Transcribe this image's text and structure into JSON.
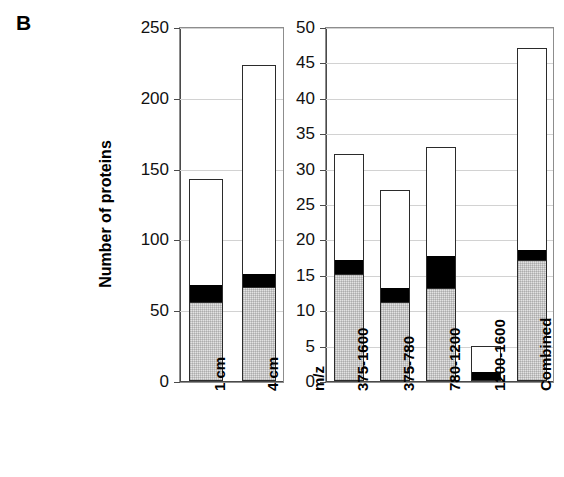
{
  "figure": {
    "panel_letter": "B",
    "y_axis_title": "Number of proteins"
  },
  "chart_data": [
    {
      "id": "left",
      "type": "bar",
      "stacked": true,
      "title": "",
      "xlabel": "",
      "ylabel": "Number of proteins",
      "ylim": [
        0,
        250
      ],
      "yticks": [
        0,
        50,
        100,
        150,
        200,
        250
      ],
      "ytick_labels": [
        "0",
        "50",
        "100",
        "150",
        "200",
        "250"
      ],
      "grid": true,
      "legend": "none",
      "categories": [
        "1 cm",
        "4 cm"
      ],
      "series": [
        {
          "name": "gray-segment",
          "color": "#e2e2e2",
          "values": [
            55,
            66
          ]
        },
        {
          "name": "black-segment",
          "color": "#000000",
          "values": [
            12,
            9
          ]
        },
        {
          "name": "white-segment",
          "color": "#ffffff",
          "values": [
            76,
            148
          ]
        }
      ],
      "totals": [
        143,
        223
      ]
    },
    {
      "id": "right",
      "type": "bar",
      "stacked": true,
      "title": "",
      "xlabel": "m/z",
      "ylabel": "",
      "ylim": [
        0,
        50
      ],
      "yticks": [
        0,
        5,
        10,
        15,
        20,
        25,
        30,
        35,
        40,
        45,
        50
      ],
      "ytick_labels": [
        "0",
        "5",
        "10",
        "15",
        "20",
        "25",
        "30",
        "35",
        "40",
        "45",
        "50"
      ],
      "grid": true,
      "legend": "none",
      "categories": [
        "375-1600",
        "375-780",
        "780-1200",
        "1200-1600",
        "Combined"
      ],
      "series": [
        {
          "name": "gray-segment",
          "color": "#e2e2e2",
          "values": [
            15,
            11,
            13,
            0,
            17
          ]
        },
        {
          "name": "black-segment",
          "color": "#000000",
          "values": [
            2,
            2,
            4.5,
            1.2,
            1.3
          ]
        },
        {
          "name": "white-segment",
          "color": "#ffffff",
          "values": [
            15,
            14,
            15.5,
            3.8,
            28.7
          ]
        }
      ],
      "totals": [
        32,
        27,
        33,
        5,
        47
      ]
    }
  ],
  "left_axis": {
    "ticks": [
      {
        "label": "250",
        "value": 250
      },
      {
        "label": "200",
        "value": 200
      },
      {
        "label": "150",
        "value": 150
      },
      {
        "label": "100",
        "value": 100
      },
      {
        "label": "50",
        "value": 50
      },
      {
        "label": "0",
        "value": 0
      }
    ],
    "categories": [
      {
        "label": "1 cm"
      },
      {
        "label": "4 cm"
      }
    ]
  },
  "right_axis": {
    "ticks": [
      {
        "label": "50",
        "value": 50
      },
      {
        "label": "45",
        "value": 45
      },
      {
        "label": "40",
        "value": 40
      },
      {
        "label": "35",
        "value": 35
      },
      {
        "label": "30",
        "value": 30
      },
      {
        "label": "25",
        "value": 25
      },
      {
        "label": "20",
        "value": 20
      },
      {
        "label": "15",
        "value": 15
      },
      {
        "label": "10",
        "value": 10
      },
      {
        "label": "5",
        "value": 5
      },
      {
        "label": "0",
        "value": 0
      }
    ],
    "axis_caption": "m/z",
    "categories": [
      {
        "label": "375-1600"
      },
      {
        "label": "375-780"
      },
      {
        "label": "780-1200"
      },
      {
        "label": "1200-1600"
      },
      {
        "label": "Combined"
      }
    ]
  }
}
